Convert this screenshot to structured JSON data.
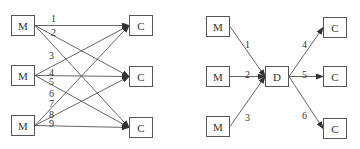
{
  "diagrams": [
    {
      "name": "point-to-point",
      "nodes": [
        {
          "id": "m1",
          "label": "M",
          "x": 11,
          "y": 15
        },
        {
          "id": "m2",
          "label": "M",
          "x": 11,
          "y": 65
        },
        {
          "id": "m3",
          "label": "M",
          "x": 11,
          "y": 115
        },
        {
          "id": "c1",
          "label": "C",
          "x": 129,
          "y": 15
        },
        {
          "id": "c2",
          "label": "C",
          "x": 129,
          "y": 66
        },
        {
          "id": "c3",
          "label": "C",
          "x": 129,
          "y": 117
        }
      ],
      "edges": [
        {
          "label": "1",
          "from": "m1",
          "to": "c1",
          "lx": 51,
          "ly": 14
        },
        {
          "label": "2",
          "from": "m1",
          "to": "c2",
          "lx": 51,
          "ly": 28
        },
        {
          "label": "3",
          "from": "m1",
          "to": "c3",
          "lx": 49,
          "ly": 51
        },
        {
          "label": "4",
          "from": "m2",
          "to": "c1",
          "lx": 49,
          "ly": 68
        },
        {
          "label": "5",
          "from": "m2",
          "to": "c2",
          "lx": 49,
          "ly": 77
        },
        {
          "label": "6",
          "from": "m2",
          "to": "c3",
          "lx": 49,
          "ly": 89
        },
        {
          "label": "7",
          "from": "m3",
          "to": "c1",
          "lx": 49,
          "ly": 99
        },
        {
          "label": "8",
          "from": "m3",
          "to": "c2",
          "lx": 49,
          "ly": 110
        },
        {
          "label": "9",
          "from": "m3",
          "to": "c3",
          "lx": 49,
          "ly": 119
        }
      ]
    },
    {
      "name": "hub",
      "nodes": [
        {
          "id": "m1",
          "label": "M",
          "x": 206,
          "y": 16
        },
        {
          "id": "m2",
          "label": "M",
          "x": 206,
          "y": 66
        },
        {
          "id": "m3",
          "label": "M",
          "x": 206,
          "y": 116
        },
        {
          "id": "d",
          "label": "D",
          "x": 265,
          "y": 66
        },
        {
          "id": "c1",
          "label": "C",
          "x": 323,
          "y": 17
        },
        {
          "id": "c2",
          "label": "C",
          "x": 323,
          "y": 66
        },
        {
          "id": "c3",
          "label": "C",
          "x": 323,
          "y": 118
        }
      ],
      "edges": [
        {
          "label": "1",
          "from": "m1",
          "to": "d",
          "lx": 245,
          "ly": 40
        },
        {
          "label": "2",
          "from": "m2",
          "to": "d",
          "lx": 245,
          "ly": 70
        },
        {
          "label": "3",
          "from": "m3",
          "to": "d",
          "lx": 245,
          "ly": 113
        },
        {
          "label": "4",
          "from": "d",
          "to": "c1",
          "lx": 302,
          "ly": 40
        },
        {
          "label": "5",
          "from": "d",
          "to": "c2",
          "lx": 302,
          "ly": 70
        },
        {
          "label": "6",
          "from": "d",
          "to": "c3",
          "lx": 302,
          "ly": 111
        }
      ]
    }
  ]
}
